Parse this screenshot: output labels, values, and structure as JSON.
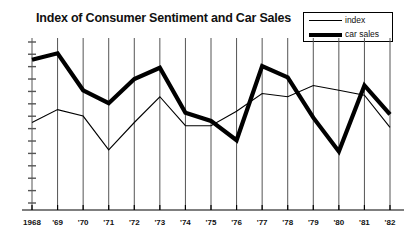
{
  "title": "Index of Consumer Sentiment and Car Sales",
  "legend": {
    "items": [
      {
        "label": "index",
        "style": "thin",
        "color": "#000000"
      },
      {
        "label": "car sales",
        "style": "thick",
        "color": "#000000"
      }
    ]
  },
  "chart_data": {
    "type": "line",
    "title": "Index of Consumer Sentiment and Car Sales",
    "xlabel": "",
    "ylabel": "",
    "grid": "vertical",
    "legend_position": "top-right",
    "x": [
      "1968",
      "'69",
      "'70",
      "'71",
      "'72",
      "'73",
      "'74",
      "'75",
      "'76",
      "'77",
      "'78",
      "'79",
      "'80",
      "'81",
      "'82"
    ],
    "categories": [
      "1968",
      "'69",
      "'70",
      "'71",
      "'72",
      "'73",
      "'74",
      "'75",
      "'76",
      "'77",
      "'78",
      "'79",
      "'80",
      "'81",
      "'82"
    ],
    "xlim": [
      0,
      14
    ],
    "ylim": [
      0,
      100
    ],
    "yticks": [
      0,
      7.7,
      15.4,
      23.1,
      30.8,
      38.5,
      46.2,
      53.9,
      61.6,
      69.3,
      77,
      84.7,
      92.4,
      100
    ],
    "ytick_labels": [],
    "series": [
      {
        "name": "index",
        "style": "thin",
        "color": "#000000",
        "values": [
          50,
          58,
          54,
          33,
          50,
          66,
          48,
          48,
          57,
          68,
          66,
          73,
          70,
          67,
          47
        ]
      },
      {
        "name": "car sales",
        "style": "thick",
        "color": "#000000",
        "values": [
          89,
          93,
          70,
          62,
          77,
          84,
          56,
          51,
          39,
          85,
          78,
          53,
          32,
          73,
          55
        ]
      }
    ]
  },
  "axis": {
    "tick_count_x": 15,
    "tick_count_y": 14
  }
}
